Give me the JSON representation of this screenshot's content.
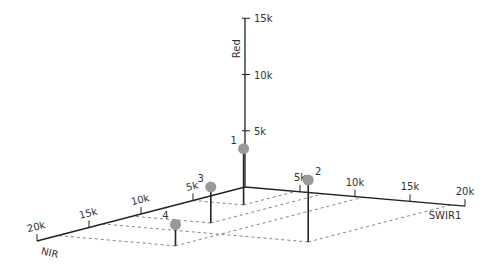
{
  "chart_data": {
    "type": "scatter",
    "subtype": "3d-stem",
    "title": "",
    "axes": {
      "x": {
        "label": "SWIR1",
        "range": [
          0,
          20000
        ],
        "ticks": [
          5000,
          10000,
          15000,
          20000
        ],
        "tick_labels": [
          "5k",
          "10k",
          "15k",
          "20k"
        ]
      },
      "y": {
        "label": "NIR",
        "range": [
          0,
          20000
        ],
        "ticks": [
          5000,
          10000,
          15000,
          20000
        ],
        "tick_labels": [
          "5k",
          "10k",
          "15k",
          "20k"
        ]
      },
      "z": {
        "label": "Red",
        "range": [
          0,
          15000
        ],
        "ticks": [
          5000,
          10000,
          15000
        ],
        "tick_labels": [
          "5k",
          "10k",
          "15k"
        ]
      }
    },
    "points": [
      {
        "label": "1",
        "SWIR1": 4600,
        "NIR": 5000,
        "Red": 5000
      },
      {
        "label": "2",
        "SWIR1": 18700,
        "NIR": 13700,
        "Red": 5500
      },
      {
        "label": "3",
        "SWIR1": 7100,
        "NIR": 10800,
        "Red": 3200
      },
      {
        "label": "4",
        "SWIR1": 10700,
        "NIR": 18000,
        "Red": 1900
      }
    ],
    "grid": false,
    "legend": "none",
    "colors": {
      "axis": "#222222",
      "point": "#999999",
      "stem": "#222222",
      "dash": "#666666"
    }
  }
}
